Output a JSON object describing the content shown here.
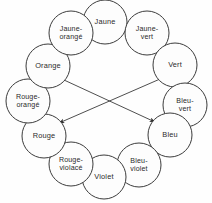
{
  "diagram": {
    "type": "color-wheel",
    "background_color": "#fefefe",
    "stroke_color": "#3c3c3c",
    "text_color": "#2b2b2b",
    "nodes": [
      {
        "id": "jaune",
        "label": "Jaune",
        "lines": [
          "Jaune"
        ],
        "cx": 105,
        "cy": 22,
        "r": 22
      },
      {
        "id": "jaune-vert",
        "label": "Jaune-vert",
        "lines": [
          "Jaune-",
          "vert"
        ],
        "cx": 147,
        "cy": 33,
        "r": 22
      },
      {
        "id": "vert",
        "label": "Vert",
        "lines": [
          "Vert"
        ],
        "cx": 175,
        "cy": 65,
        "r": 22
      },
      {
        "id": "bleu-vert",
        "label": "Bleu-vert",
        "lines": [
          "Bleu-",
          "vert"
        ],
        "cx": 185,
        "cy": 105,
        "r": 22
      },
      {
        "id": "bleu",
        "label": "Bleu",
        "lines": [
          "Bleu"
        ],
        "cx": 170,
        "cy": 135,
        "r": 22
      },
      {
        "id": "bleu-violet",
        "label": "Bleu-violet",
        "lines": [
          "Bleu-",
          "violet"
        ],
        "cx": 139,
        "cy": 165,
        "r": 22
      },
      {
        "id": "violet",
        "label": "Violet",
        "lines": [
          "Violet"
        ],
        "cx": 104,
        "cy": 177,
        "r": 22
      },
      {
        "id": "rouge-violace",
        "label": "Rouge-violacé",
        "lines": [
          "Rouge-",
          "violacé"
        ],
        "cx": 71,
        "cy": 164,
        "r": 22
      },
      {
        "id": "rouge",
        "label": "Rouge",
        "lines": [
          "Rouge"
        ],
        "cx": 44,
        "cy": 136,
        "r": 22
      },
      {
        "id": "rouge-orange",
        "label": "Rouge-orangé",
        "lines": [
          "Rouge-",
          "orangé"
        ],
        "cx": 28,
        "cy": 101,
        "r": 22
      },
      {
        "id": "orange",
        "label": "Orange",
        "lines": [
          "Orange"
        ],
        "cx": 48,
        "cy": 66,
        "r": 22
      },
      {
        "id": "jaune-orange",
        "label": "Jaune-orangé",
        "lines": [
          "Jaune-",
          "orangé"
        ],
        "cx": 71,
        "cy": 33,
        "r": 22
      }
    ],
    "axes": [
      {
        "id": "axis-orange-bleu",
        "from": "orange",
        "to": "bleu",
        "x1": 64,
        "y1": 80,
        "x2": 155,
        "y2": 122,
        "arrow_start": true,
        "arrow_end": true
      },
      {
        "id": "axis-vert-rouge",
        "from": "vert",
        "to": "rouge",
        "x1": 160,
        "y1": 79,
        "x2": 59,
        "y2": 123,
        "arrow_start": true,
        "arrow_end": true
      }
    ]
  }
}
